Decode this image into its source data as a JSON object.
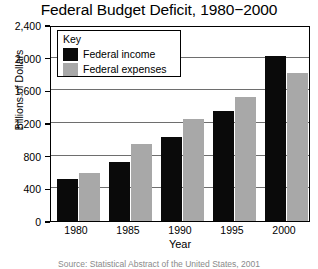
{
  "chart_data": {
    "type": "bar",
    "title": "Federal Budget Deficit, 1980−2000",
    "xlabel": "Year",
    "ylabel": "Billions of Dollars",
    "categories": [
      "1980",
      "1985",
      "1990",
      "1995",
      "2000"
    ],
    "series": [
      {
        "name": "Federal income",
        "color": "#0a0a0a",
        "values": [
          520,
          720,
          1030,
          1350,
          2020
        ]
      },
      {
        "name": "Federal expenses",
        "color": "#a8a8a8",
        "values": [
          590,
          940,
          1250,
          1520,
          1810
        ]
      }
    ],
    "ylim": [
      0,
      2400
    ],
    "ytick_values": [
      0,
      400,
      800,
      1200,
      1600,
      2000,
      2400
    ],
    "ytick_labels": [
      "0",
      "400",
      "800",
      "1,200",
      "1,600",
      "2,000",
      "2,400"
    ],
    "grid": true,
    "legend_position": "top-left",
    "legend_title": "Key"
  },
  "caption": {
    "source_text": "Source: Statistical Abstract of the United States, 2001"
  }
}
